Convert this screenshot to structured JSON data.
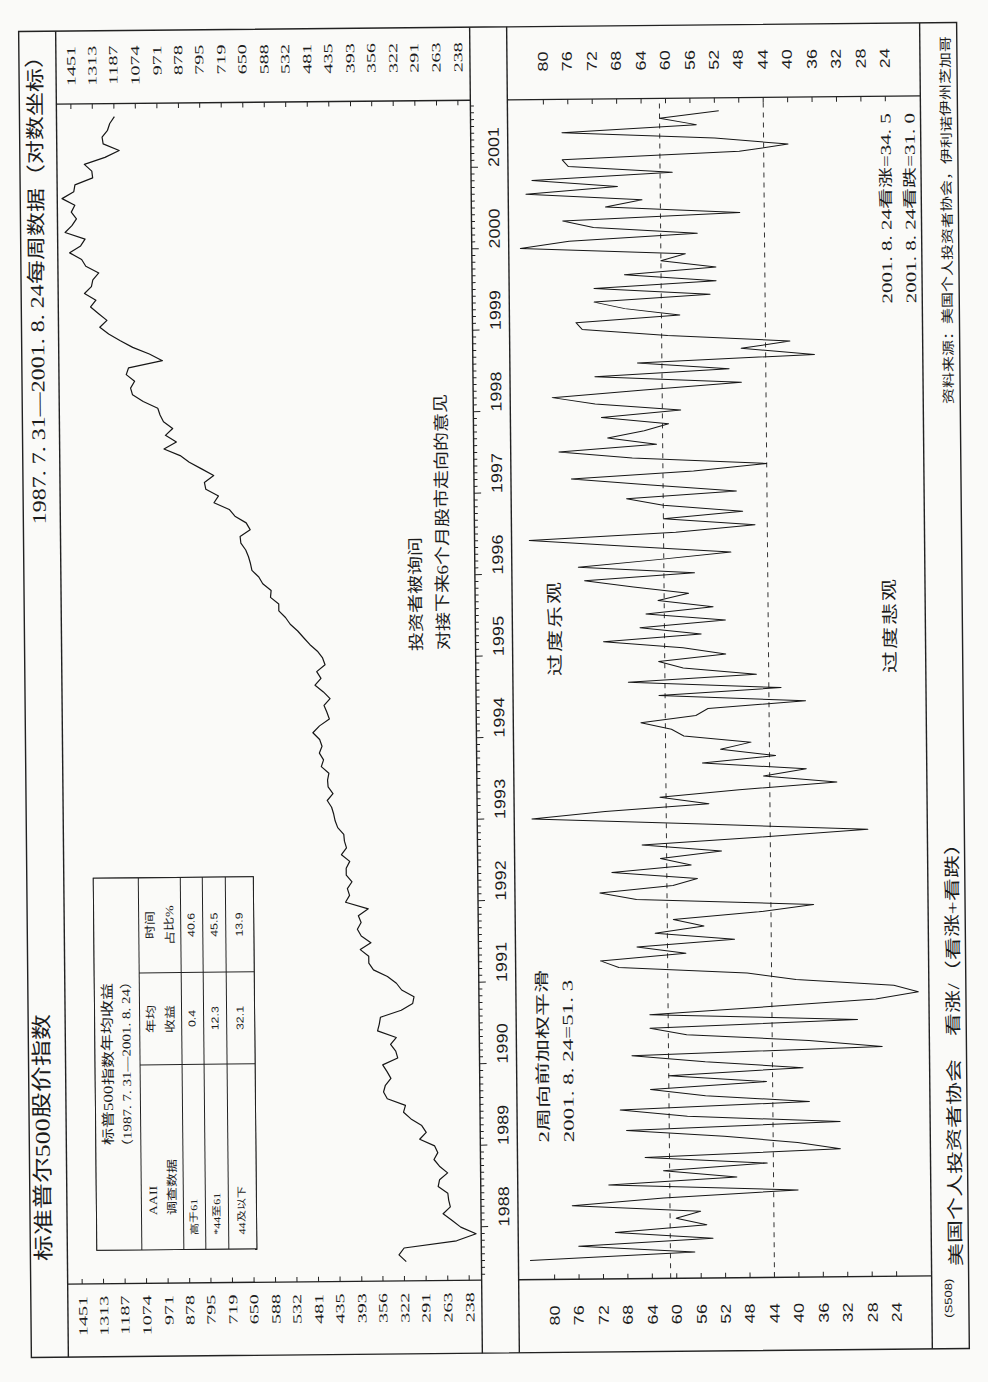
{
  "header": {
    "title": "标准普尔500股价指数",
    "subtitle": "1987. 7. 31—2001. 8. 24每周数据（对数坐标）"
  },
  "table": {
    "title": "标普500指数年均收益",
    "period": "（1987. 7. 31—2001. 8. 24）",
    "headers": {
      "survey": [
        "AAII",
        "调查数据"
      ],
      "annual_return": [
        "年均",
        "收益"
      ],
      "time_share": [
        "时间",
        "占比%"
      ]
    },
    "rows": [
      {
        "range": "高于61",
        "annual_return": "0.4",
        "time_share": "40.6"
      },
      {
        "range": "*44至61",
        "annual_return": "12.3",
        "time_share": "45.5"
      },
      {
        "range": "44及以下",
        "annual_return": "32.1",
        "time_share": "13.9"
      }
    ]
  },
  "annotations": {
    "survey_note": [
      "投资者被询问",
      "对接下来6个月股市走向的意见"
    ],
    "smoothing_note": [
      "2周向前加权平滑",
      "2001. 8. 24=51. 3"
    ],
    "over_optimistic": "过度乐观",
    "over_pessimistic": "过度悲观",
    "latest_readings": [
      "2001. 8. 24看涨=34. 5",
      "2001. 8. 24看跌=31. 0"
    ]
  },
  "axes": {
    "sp500_ticks": [
      1451,
      1313,
      1187,
      1074,
      971,
      878,
      795,
      719,
      650,
      588,
      532,
      481,
      435,
      393,
      356,
      322,
      291,
      263,
      238
    ],
    "aaii_ticks": [
      80,
      76,
      72,
      68,
      64,
      60,
      56,
      52,
      48,
      44,
      40,
      36,
      32,
      28,
      24
    ],
    "years": [
      1988,
      1989,
      1990,
      1991,
      1992,
      1993,
      1994,
      1995,
      1996,
      1997,
      1998,
      1999,
      2000,
      2001
    ]
  },
  "footer": {
    "code": "(S508)",
    "indicator": "美国个人投资者协会　看涨/（看涨+看跌）",
    "source": "资料来源：美国个人投资者协会，伊利诺伊州芝加哥"
  },
  "chart_data": [
    {
      "type": "line",
      "title": "标准普尔500股价指数",
      "subtitle": "1987.7.31—2001.8.24每周数据（对数坐标）",
      "xlabel": "",
      "ylabel": "",
      "y_scale": "log",
      "ylim": [
        238,
        1451
      ],
      "yticks": [
        1451,
        1313,
        1187,
        1074,
        971,
        878,
        795,
        719,
        650,
        588,
        532,
        481,
        435,
        393,
        356,
        322,
        291,
        263,
        238
      ],
      "xticks": [
        1988,
        1989,
        1990,
        1991,
        1992,
        1993,
        1994,
        1995,
        1996,
        1997,
        1998,
        1999,
        2000,
        2001
      ],
      "x_start": 1987.58,
      "x_step": 0.08333,
      "grid": false,
      "series": [
        {
          "name": "标准普尔500指数",
          "values": [
            319,
            330,
            322,
            252,
            230,
            247,
            257,
            268,
            259,
            261,
            262,
            274,
            272,
            262,
            272,
            279,
            274,
            278,
            298,
            289,
            295,
            310,
            321,
            318,
            346,
            352,
            349,
            340,
            346,
            353,
            329,
            332,
            340,
            331,
            361,
            358,
            356,
            323,
            306,
            304,
            322,
            330,
            344,
            367,
            375,
            375,
            390,
            371,
            388,
            395,
            388,
            393,
            375,
            417,
            409,
            413,
            404,
            415,
            415,
            408,
            424,
            414,
            418,
            419,
            431,
            436,
            439,
            443,
            452,
            440,
            450,
            451,
            448,
            464,
            459,
            468,
            462,
            467,
            482,
            467,
            446,
            451,
            457,
            444,
            458,
            476,
            463,
            472,
            454,
            459,
            470,
            487,
            501,
            515,
            533,
            545,
            562,
            562,
            584,
            582,
            605,
            616,
            636,
            640,
            646,
            654,
            669,
            671,
            640,
            652,
            687,
            705,
            757,
            741,
            786,
            791,
            757,
            801,
            848,
            885,
            954,
            900,
            947,
            915,
            955,
            970,
            980,
            1049,
            1102,
            1112,
            1091,
            1134,
            1121,
            957,
            1017,
            1099,
            1164,
            1229,
            1280,
            1238,
            1286,
            1335,
            1302,
            1373,
            1329,
            1320,
            1283,
            1363,
            1389,
            1469,
            1395,
            1366,
            1499,
            1452,
            1421,
            1455,
            1431,
            1518,
            1437,
            1429,
            1315,
            1320,
            1366,
            1240,
            1160,
            1250,
            1256,
            1224,
            1211,
            1185
          ]
        }
      ],
      "table": {
        "title": "标普500指数年均收益 (1987.7.31—2001.8.24)",
        "columns": [
          "AAII调查数据",
          "年均收益",
          "时间占比%"
        ],
        "rows": [
          [
            "高于61",
            0.4,
            40.6
          ],
          [
            "*44至61",
            12.3,
            45.5
          ],
          [
            "44及以下",
            32.1,
            13.9
          ]
        ]
      },
      "annotations": [
        "投资者被询问对接下来6个月股市走向的意见"
      ]
    },
    {
      "type": "line",
      "title": "美国个人投资者协会 看涨/（看涨+看跌）",
      "xlabel": "",
      "ylabel": "",
      "y_scale": "linear",
      "ylim": [
        24,
        80
      ],
      "yticks": [
        80,
        76,
        72,
        68,
        64,
        60,
        56,
        52,
        48,
        44,
        40,
        36,
        32,
        28,
        24
      ],
      "xticks": [
        1988,
        1989,
        1990,
        1991,
        1992,
        1993,
        1994,
        1995,
        1996,
        1997,
        1998,
        1999,
        2000,
        2001
      ],
      "x_start": 1987.58,
      "x_step": 0.08333,
      "grid": false,
      "reference_lines": [
        {
          "value": 61,
          "style": "dashed",
          "label": "过度乐观"
        },
        {
          "value": 44,
          "style": "dashed",
          "label": "过度悲观"
        }
      ],
      "series": [
        {
          "name": "看涨/（看涨+看跌）2周向前加权平滑",
          "values": [
            84,
            57,
            76,
            54,
            70,
            55,
            60,
            56,
            77,
            62,
            40,
            71,
            50,
            62,
            45,
            65,
            33,
            40,
            52,
            68,
            33,
            58,
            69,
            38,
            55,
            64,
            45,
            61,
            39,
            55,
            67,
            26,
            38,
            58,
            64,
            30,
            64,
            45,
            27,
            20,
            24,
            40,
            48,
            69,
            72,
            58,
            66,
            50,
            63,
            55,
            60,
            46,
            37,
            66,
            72,
            60,
            56,
            70,
            57,
            62,
            52,
            65,
            46,
            28,
            55,
            83,
            71,
            54,
            62,
            49,
            33,
            45,
            38,
            55,
            43,
            52,
            47,
            58,
            60,
            65,
            56,
            54,
            38,
            62,
            42,
            67,
            46,
            58,
            62,
            51,
            58,
            71,
            55,
            65,
            51,
            64,
            53,
            62,
            57,
            66,
            74,
            56,
            75,
            62,
            50,
            67,
            83,
            59,
            46,
            61,
            48,
            61,
            67,
            49,
            63,
            76,
            56,
            44,
            66,
            78,
            62,
            70,
            64,
            60,
            71,
            58,
            72,
            79,
            64,
            48,
            72,
            50,
            65,
            36,
            48,
            40,
            60,
            74,
            75,
            58,
            67,
            72,
            53,
            72,
            52,
            67,
            52,
            61,
            57,
            84,
            76,
            55,
            72,
            77,
            48,
            70,
            64,
            83,
            68,
            82,
            59,
            76,
            77,
            48,
            40,
            52,
            77,
            55,
            61,
            51.3
          ]
        }
      ],
      "annotations": [
        "2周向前加权平滑 2001.8.24=51.3",
        "2001.8.24看涨=34.5",
        "2001.8.24看跌=31.0"
      ],
      "last_value": 51.3,
      "bullish_last": 34.5,
      "bearish_last": 31.0
    }
  ]
}
